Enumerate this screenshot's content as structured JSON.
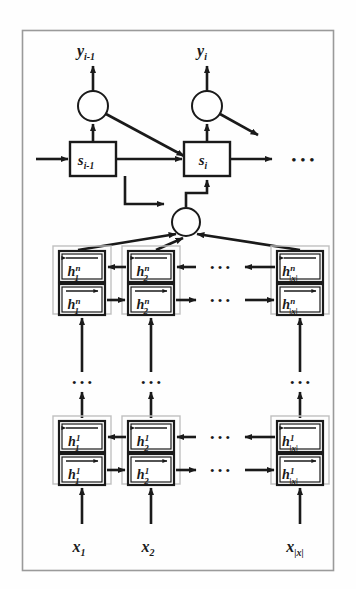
{
  "figure": {
    "name": "bidirectional-deep-rnn-encoder-decoder-attention-diagram",
    "border_color": "#8a8a8a",
    "ink_color": "#1a1a1a",
    "group_box_color": "#b8b8b8",
    "background": "#fefefe"
  },
  "decoder": {
    "outputs": [
      {
        "id": "y-prev",
        "label": "y",
        "sub": "i-1",
        "cx": 93
      },
      {
        "id": "y-curr",
        "label": "y",
        "sub": "i",
        "cx": 207
      }
    ],
    "states": [
      {
        "id": "s-prev",
        "label": "s",
        "sub": "i-1",
        "cx": 93
      },
      {
        "id": "s-curr",
        "label": "s",
        "sub": "i",
        "cx": 207
      }
    ],
    "ellipsis": "• • •"
  },
  "attention": {
    "node_label": "",
    "cx": 186,
    "cy": 222
  },
  "encoder": {
    "columns": [
      {
        "id": "col-1",
        "sub": "1",
        "cx": 82
      },
      {
        "id": "col-2",
        "sub": "2",
        "cx": 151
      },
      {
        "id": "col-n",
        "sub": "|x|",
        "cx": 300
      }
    ],
    "layers": [
      {
        "id": "layer-n",
        "sup": "n",
        "y_backward": 262,
        "y_forward": 296
      },
      {
        "id": "layer-1",
        "sup": "1",
        "y_backward": 432,
        "y_forward": 466
      }
    ],
    "symbol": "h",
    "horizontal_ellipsis": "• • •",
    "vertical_ellipsis": "• • •"
  },
  "inputs": [
    {
      "id": "x-1",
      "label": "x",
      "sub": "1",
      "cx": 82
    },
    {
      "id": "x-2",
      "label": "x",
      "sub": "2",
      "cx": 151
    },
    {
      "id": "x-n",
      "label": "x",
      "sub": "|x|",
      "cx": 300
    }
  ]
}
